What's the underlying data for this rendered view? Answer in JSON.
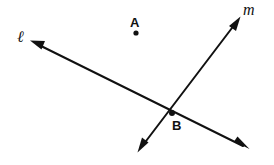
{
  "figure": {
    "width": 274,
    "height": 165,
    "background_color": "#ffffff",
    "ink_color": "#111111",
    "stroke_width": 2
  },
  "points": [
    {
      "id": "A",
      "label": "A",
      "x": 136,
      "y": 33,
      "label_x": 136,
      "label_y": 22,
      "dot_radius": 2.6,
      "on_line": null
    },
    {
      "id": "B",
      "label": "B",
      "x": 172,
      "y": 113,
      "label_x": 177,
      "label_y": 126,
      "dot_radius": 3.0,
      "on_line": "intersection of l and m"
    }
  ],
  "lines": [
    {
      "id": "l",
      "label": "ℓ",
      "label_x": 24,
      "label_y": 37,
      "x1": 31,
      "y1": 41,
      "x2": 248,
      "y2": 148,
      "arrow_start": true,
      "arrow_end": true,
      "slope": 0.493,
      "description": "line l, rises to the left, arrowheads at both ends"
    },
    {
      "id": "m",
      "label": "m",
      "label_x": 251,
      "label_y": 11,
      "x1": 240,
      "y1": 17,
      "x2": 138,
      "y2": 152,
      "arrow_start": true,
      "arrow_end": true,
      "slope": -1.324,
      "description": "line m, rises to the right, arrowheads at both ends"
    }
  ],
  "arrowheads": [
    {
      "id": "l-upper-left",
      "x": 31,
      "y": 41
    },
    {
      "id": "l-lower-right",
      "x": 248,
      "y": 148
    },
    {
      "id": "m-upper-right",
      "x": 240,
      "y": 17
    },
    {
      "id": "m-lower-left",
      "x": 138,
      "y": 152
    }
  ]
}
